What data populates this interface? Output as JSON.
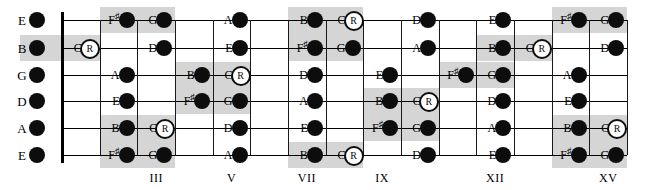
{
  "diagram": {
    "type": "guitar-fretboard",
    "geometry": {
      "nut_x": 62,
      "board_right_x": 627,
      "fret_width": 37.67,
      "fret_count": 15,
      "open_dot_x": 37,
      "string_y": [
        20,
        48,
        75,
        101,
        128,
        155
      ]
    },
    "strings": [
      {
        "index": 0,
        "open_label": "E"
      },
      {
        "index": 1,
        "open_label": "B"
      },
      {
        "index": 2,
        "open_label": "G"
      },
      {
        "index": 3,
        "open_label": "D"
      },
      {
        "index": 4,
        "open_label": "A"
      },
      {
        "index": 5,
        "open_label": "E"
      }
    ],
    "fret_markers": [
      {
        "label": "III",
        "fret": 3
      },
      {
        "label": "V",
        "fret": 5
      },
      {
        "label": "VII",
        "fret": 7
      },
      {
        "label": "IX",
        "fret": 9
      },
      {
        "label": "XII",
        "fret": 12
      },
      {
        "label": "XV",
        "fret": 15
      }
    ],
    "colors": {
      "note_fill": "#0d0d0d",
      "root_fill": "#ffffff",
      "shade": "#d5d5d5",
      "line": "#000000",
      "background": "#ffffff"
    },
    "legend": {
      "root_marker": "R"
    },
    "notes": [
      {
        "string": 0,
        "fret": 0,
        "label": "E",
        "root": false
      },
      {
        "string": 1,
        "fret": 0,
        "label": "B",
        "root": false
      },
      {
        "string": 2,
        "fret": 0,
        "label": "G",
        "root": false
      },
      {
        "string": 3,
        "fret": 0,
        "label": "D",
        "root": false
      },
      {
        "string": 4,
        "fret": 0,
        "label": "A",
        "root": false
      },
      {
        "string": 5,
        "fret": 0,
        "label": "E",
        "root": false
      },
      {
        "string": 1,
        "fret": 1,
        "label": "C",
        "root": true
      },
      {
        "string": 2,
        "fret": 2,
        "label": "A",
        "root": false
      },
      {
        "string": 3,
        "fret": 2,
        "label": "E",
        "root": false
      },
      {
        "string": 0,
        "fret": 2,
        "label": "F#",
        "root": false
      },
      {
        "string": 4,
        "fret": 2,
        "label": "B",
        "root": false
      },
      {
        "string": 5,
        "fret": 2,
        "label": "F#",
        "root": false
      },
      {
        "string": 0,
        "fret": 3,
        "label": "G",
        "root": false
      },
      {
        "string": 1,
        "fret": 3,
        "label": "D",
        "root": false
      },
      {
        "string": 4,
        "fret": 3,
        "label": "C",
        "root": true
      },
      {
        "string": 5,
        "fret": 3,
        "label": "G",
        "root": false
      },
      {
        "string": 2,
        "fret": 4,
        "label": "B",
        "root": false
      },
      {
        "string": 3,
        "fret": 4,
        "label": "F#",
        "root": false
      },
      {
        "string": 0,
        "fret": 5,
        "label": "A",
        "root": false
      },
      {
        "string": 1,
        "fret": 5,
        "label": "E",
        "root": false
      },
      {
        "string": 2,
        "fret": 5,
        "label": "C",
        "root": true
      },
      {
        "string": 3,
        "fret": 5,
        "label": "G",
        "root": false
      },
      {
        "string": 4,
        "fret": 5,
        "label": "D",
        "root": false
      },
      {
        "string": 5,
        "fret": 5,
        "label": "A",
        "root": false
      },
      {
        "string": 0,
        "fret": 7,
        "label": "B",
        "root": false
      },
      {
        "string": 1,
        "fret": 7,
        "label": "F#",
        "root": false
      },
      {
        "string": 2,
        "fret": 7,
        "label": "D",
        "root": false
      },
      {
        "string": 3,
        "fret": 7,
        "label": "A",
        "root": false
      },
      {
        "string": 4,
        "fret": 7,
        "label": "E",
        "root": false
      },
      {
        "string": 5,
        "fret": 7,
        "label": "B",
        "root": false
      },
      {
        "string": 0,
        "fret": 8,
        "label": "C",
        "root": true
      },
      {
        "string": 1,
        "fret": 8,
        "label": "G",
        "root": false
      },
      {
        "string": 5,
        "fret": 8,
        "label": "C",
        "root": true
      },
      {
        "string": 2,
        "fret": 9,
        "label": "E",
        "root": false
      },
      {
        "string": 3,
        "fret": 9,
        "label": "B",
        "root": false
      },
      {
        "string": 4,
        "fret": 9,
        "label": "F#",
        "root": false
      },
      {
        "string": 0,
        "fret": 10,
        "label": "D",
        "root": false
      },
      {
        "string": 1,
        "fret": 10,
        "label": "A",
        "root": false
      },
      {
        "string": 3,
        "fret": 10,
        "label": "C",
        "root": true
      },
      {
        "string": 4,
        "fret": 10,
        "label": "G",
        "root": false
      },
      {
        "string": 5,
        "fret": 10,
        "label": "D",
        "root": false
      },
      {
        "string": 2,
        "fret": 11,
        "label": "F#",
        "root": false
      },
      {
        "string": 0,
        "fret": 12,
        "label": "E",
        "root": false
      },
      {
        "string": 1,
        "fret": 12,
        "label": "B",
        "root": false
      },
      {
        "string": 2,
        "fret": 12,
        "label": "G",
        "root": false
      },
      {
        "string": 3,
        "fret": 12,
        "label": "D",
        "root": false
      },
      {
        "string": 4,
        "fret": 12,
        "label": "A",
        "root": false
      },
      {
        "string": 5,
        "fret": 12,
        "label": "E",
        "root": false
      },
      {
        "string": 1,
        "fret": 13,
        "label": "C",
        "root": true
      },
      {
        "string": 0,
        "fret": 14,
        "label": "F#",
        "root": false
      },
      {
        "string": 2,
        "fret": 14,
        "label": "A",
        "root": false
      },
      {
        "string": 3,
        "fret": 14,
        "label": "E",
        "root": false
      },
      {
        "string": 4,
        "fret": 14,
        "label": "B",
        "root": false
      },
      {
        "string": 5,
        "fret": 14,
        "label": "F#",
        "root": false
      },
      {
        "string": 0,
        "fret": 15,
        "label": "G",
        "root": false
      },
      {
        "string": 1,
        "fret": 15,
        "label": "D",
        "root": false
      },
      {
        "string": 4,
        "fret": 15,
        "label": "C",
        "root": true
      },
      {
        "string": 5,
        "fret": 15,
        "label": "G",
        "root": false
      }
    ],
    "shades": [
      {
        "string_from": 1,
        "string_to": 1,
        "fret_from": 0,
        "fret_to": 1
      },
      {
        "string_from": 0,
        "string_to": 0,
        "fret_from": 2,
        "fret_to": 3
      },
      {
        "string_from": 4,
        "string_to": 5,
        "fret_from": 2,
        "fret_to": 3
      },
      {
        "string_from": 2,
        "string_to": 3,
        "fret_from": 4,
        "fret_to": 5
      },
      {
        "string_from": 0,
        "string_to": 1,
        "fret_from": 7,
        "fret_to": 8
      },
      {
        "string_from": 5,
        "string_to": 5,
        "fret_from": 7,
        "fret_to": 8
      },
      {
        "string_from": 3,
        "string_to": 4,
        "fret_from": 9,
        "fret_to": 10
      },
      {
        "string_from": 2,
        "string_to": 2,
        "fret_from": 11,
        "fret_to": 12
      },
      {
        "string_from": 1,
        "string_to": 1,
        "fret_from": 12,
        "fret_to": 13
      },
      {
        "string_from": 0,
        "string_to": 0,
        "fret_from": 14,
        "fret_to": 15
      },
      {
        "string_from": 4,
        "string_to": 5,
        "fret_from": 14,
        "fret_to": 15
      }
    ]
  }
}
